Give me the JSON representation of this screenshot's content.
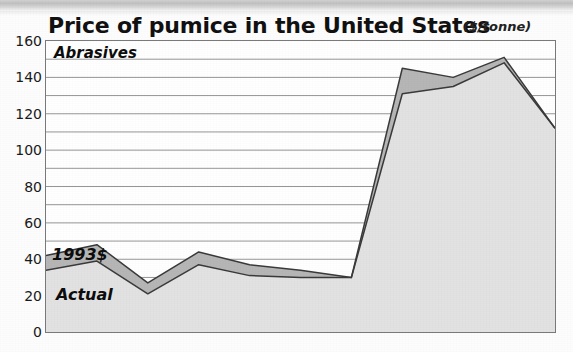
{
  "figure": {
    "title": "Price of pumice in the United States",
    "unit": "($/tonne)",
    "annotations": {
      "abrasives": "Abrasives",
      "constant_dollars": "1993$",
      "actual": "Actual"
    }
  },
  "colors": {
    "plot_border": "#7a7a7a",
    "gridline": "#8a8a8a",
    "actual_fill": "#e2e2e2",
    "constant_fill": "#b6b6b6",
    "series_line": "#3a3a3a",
    "title_text": "#111111",
    "tick_text": "#1a1a1a"
  },
  "chart_data": {
    "type": "area",
    "title": "Price of pumice in the United States",
    "subtitle": "",
    "xlabel": "",
    "ylabel": "($/tonne)",
    "ylim": [
      0,
      160
    ],
    "ytick_labels": [
      "160",
      "140",
      "120",
      "100",
      "80",
      "60",
      "40",
      "20",
      "0"
    ],
    "ytick_values": [
      160,
      140,
      120,
      100,
      80,
      60,
      40,
      20,
      0
    ],
    "grid": true,
    "grid_interval": 10,
    "grid_axis": "y",
    "legend": "inline-annotations",
    "legend_position": "inside-plot",
    "stacking": "overlaid",
    "x": [
      0,
      1,
      2,
      3,
      4,
      5,
      6,
      7,
      8,
      9,
      10
    ],
    "series": [
      {
        "name": "1993$",
        "values": [
          42,
          48,
          27,
          44,
          37,
          34,
          30,
          145,
          140,
          151,
          112
        ]
      },
      {
        "name": "Actual",
        "values": [
          34,
          39,
          21,
          37,
          31,
          30,
          30,
          131,
          135,
          148,
          112
        ]
      }
    ],
    "annotations": [
      {
        "text": "Abrasives",
        "position": "top-left-inside"
      },
      {
        "text": "1993$",
        "position": "upper-band-left"
      },
      {
        "text": "Actual",
        "position": "lower-band-left"
      }
    ]
  }
}
